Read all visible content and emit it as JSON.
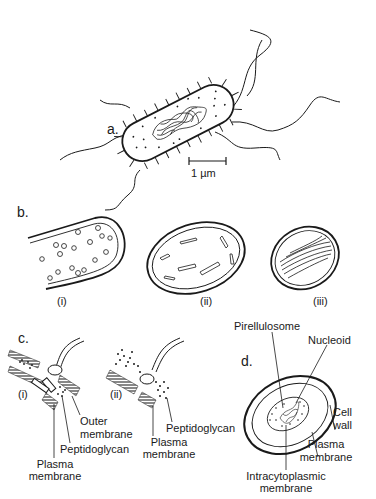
{
  "figure": {
    "panels": {
      "a": {
        "letter": "a.",
        "scale_bar": "1 µm"
      },
      "b": {
        "letter": "b.",
        "subpanels": [
          "(i)",
          "(ii)",
          "(iii)"
        ]
      },
      "c": {
        "letter": "c.",
        "subpanels": [
          "(i)",
          "(ii)"
        ],
        "labels_i": {
          "outer_line1": "Outer",
          "outer_line2": "membrane",
          "peptidoglycan": "Peptidoglycan",
          "plasma_line1": "Plasma",
          "plasma_line2": "membrane"
        },
        "labels_ii": {
          "peptidoglycan": "Peptidoglycan",
          "plasma_line1": "Plasma",
          "plasma_line2": "membrane"
        }
      },
      "d": {
        "letter": "d.",
        "labels": {
          "pirellulosome": "Pirellulosome",
          "nucleoid": "Nucleoid",
          "cell_wall_line1": "Cell",
          "cell_wall_line2": "wall",
          "plasma_line1": "Plasma",
          "plasma_line2": "membrane",
          "intracyto_line1": "Intracytoplasmic",
          "intracyto_line2": "membrane"
        }
      }
    },
    "colors": {
      "ink": "#1a1a1a",
      "hatch": "#6b6b6b",
      "background": "#ffffff"
    }
  }
}
